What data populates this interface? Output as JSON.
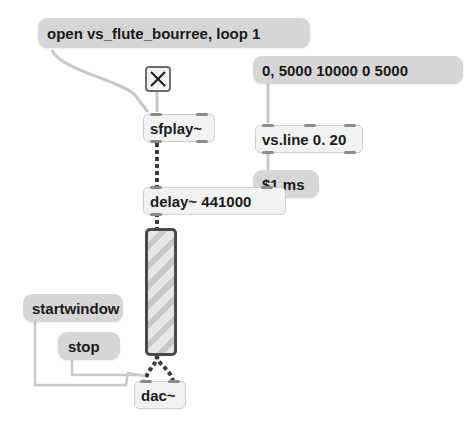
{
  "patcher": {
    "messages": {
      "open": "open vs_flute_bourree, loop 1",
      "line_values": "0, 5000 10000 0 5000",
      "ms": "$1 ms",
      "startwindow": "startwindow",
      "stop": "stop"
    },
    "objects": {
      "sfplay": "sfplay~",
      "vsline": "vs.line 0. 20",
      "delay": "delay~ 441000",
      "dac": "dac~"
    },
    "toggle": {
      "state": "on",
      "icon": "x-mark"
    },
    "meter": {
      "type": "level-meter"
    },
    "colors": {
      "message_bg": "#d6d6d6",
      "object_bg": "#f2f2f2",
      "cord_control": "#c4c4c4",
      "cord_signal": "#3a3a3a",
      "meter_border": "#4a4a4a"
    }
  }
}
